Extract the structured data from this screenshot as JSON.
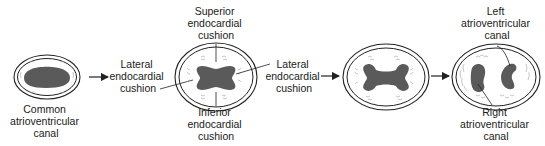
{
  "colors": {
    "outline": "#222222",
    "canal_fill": "#5a5a5a",
    "hatch": "#9a9a9a",
    "text": "#1a1a1a",
    "background": "#ffffff"
  },
  "stages": [
    {
      "id": "stage-1",
      "labels": {
        "common_av_canal": [
          "Common",
          "atrioventricular",
          "canal"
        ]
      }
    },
    {
      "id": "stage-2",
      "labels": {
        "lateral_left": [
          "Lateral",
          "endocardial",
          "cushion"
        ],
        "superior": [
          "Superior",
          "endocardial",
          "cushion"
        ],
        "inferior": [
          "Inferior",
          "endocardial",
          "cushion"
        ],
        "lateral_right": [
          "Lateral",
          "endocardial",
          "cushion"
        ]
      }
    },
    {
      "id": "stage-3",
      "labels": {}
    },
    {
      "id": "stage-4",
      "labels": {
        "left_av_canal": [
          "Left",
          "atrioventricular",
          "canal"
        ],
        "right_av_canal": [
          "Right",
          "atrioventricular",
          "canal"
        ]
      }
    }
  ],
  "arrows": [
    "arrow-1-to-2",
    "arrow-2-to-3",
    "arrow-3-to-4"
  ]
}
